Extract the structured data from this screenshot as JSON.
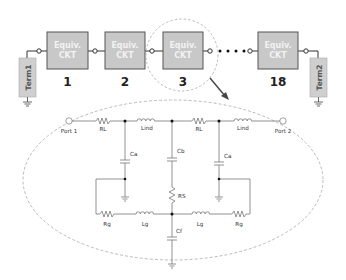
{
  "diagram": {
    "colors": {
      "box_fill": "#c8c8c8",
      "box_stroke": "#555555",
      "term_fill": "#cfcfcf",
      "wire": "#333333",
      "schematic_wire": "#777777",
      "dashed": "#999999",
      "arrow": "#444444"
    },
    "chain": {
      "boxes": [
        {
          "line1": "Equiv.",
          "line2": "CKT",
          "index": "1"
        },
        {
          "line1": "Equiv.",
          "line2": "CKT",
          "index": "2"
        },
        {
          "line1": "Equiv.",
          "line2": "CKT",
          "index": "3"
        },
        {
          "line1": "Equiv.",
          "line2": "CKT",
          "index": "18"
        }
      ],
      "ellipsis": "• • • •",
      "terminals": [
        {
          "label": "Term1"
        },
        {
          "label": "Term2"
        }
      ],
      "highlighted_index": "3"
    },
    "schematic": {
      "ports": [
        {
          "label": "Port 1"
        },
        {
          "label": "Port 2"
        }
      ],
      "components": {
        "RL_left": "RL",
        "Lind_left": "Lind",
        "RL_right": "RL",
        "Lind_right": "Lind",
        "Ca_left": "Ca",
        "Cb": "Cb",
        "Ca_right": "Ca",
        "RS": "RS",
        "Rg_left": "Rg",
        "Lg_left": "Lg",
        "Lg_right": "Lg",
        "Rg_right": "Rg",
        "Cf": "Cf"
      }
    }
  }
}
